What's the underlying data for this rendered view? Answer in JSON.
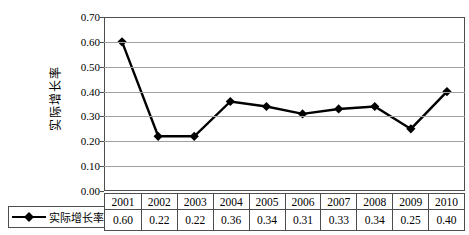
{
  "chart_data": {
    "type": "line",
    "categories": [
      "2001",
      "2002",
      "2003",
      "2004",
      "2005",
      "2006",
      "2007",
      "2008",
      "2009",
      "2010"
    ],
    "series": [
      {
        "name": "实际增长率",
        "values": [
          0.6,
          0.22,
          0.22,
          0.36,
          0.34,
          0.31,
          0.33,
          0.34,
          0.25,
          0.4
        ]
      }
    ],
    "title": "",
    "xlabel": "",
    "ylabel": "实际增长率",
    "ylim": [
      0.0,
      0.7
    ],
    "ytick_step": 0.1,
    "ytick_labels": [
      "0.00",
      "0.10",
      "0.20",
      "0.30",
      "0.40",
      "0.50",
      "0.60",
      "0.70"
    ],
    "grid": true,
    "legend_position": "bottom-left",
    "marker": "diamond",
    "data_table_shown": true
  },
  "legend": {
    "label": "实际增长率"
  },
  "colors": {
    "background": "#ffffff",
    "line": "#000000",
    "marker": "#000000",
    "grid": "#a0a0a0",
    "frame": "#4d4d4d",
    "text": "#000000"
  }
}
